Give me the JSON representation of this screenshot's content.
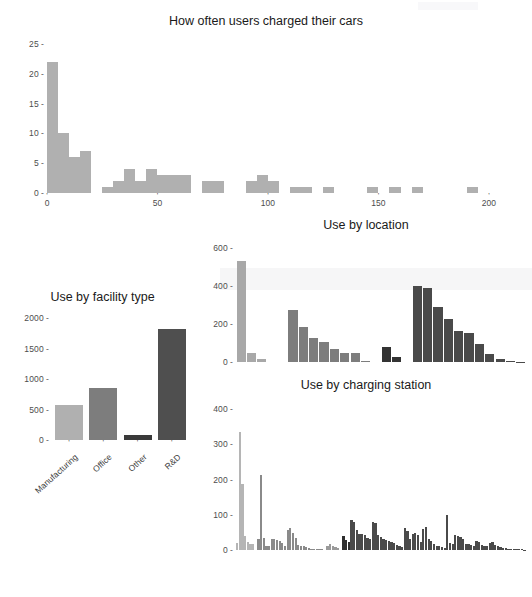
{
  "page": {
    "background": "#ffffff",
    "text_color": "#1a1a1a"
  },
  "colors": {
    "light_gray": "#b0b0b0",
    "mid_gray": "#808080",
    "dark_gray": "#555555",
    "darkest": "#3a3a3a",
    "axis_text": "#4d4d4d"
  },
  "charts": [
    {
      "id": "charge-frequency",
      "title": "How often users charged their cars"
    },
    {
      "id": "use-by-facility-type",
      "title": "Use by facility type"
    },
    {
      "id": "use-by-location",
      "title": "Use by location"
    },
    {
      "id": "use-by-charging-station",
      "title": "Use by charging station"
    }
  ],
  "chart_data": [
    {
      "type": "bar",
      "id": "charge-frequency",
      "title": "How often users charged their cars",
      "xlabel": "",
      "ylabel": "",
      "xlim": [
        0,
        210
      ],
      "ylim": [
        0,
        26
      ],
      "xticks": [
        0,
        50,
        100,
        150,
        200
      ],
      "yticks": [
        0,
        5,
        10,
        15,
        20,
        25
      ],
      "grid": false,
      "bar_color": "#b0b0b0",
      "bin_width": 5,
      "bins": [
        {
          "x0": 0,
          "x1": 5,
          "value": 22
        },
        {
          "x0": 5,
          "x1": 10,
          "value": 10
        },
        {
          "x0": 10,
          "x1": 15,
          "value": 6
        },
        {
          "x0": 15,
          "x1": 20,
          "value": 7
        },
        {
          "x0": 20,
          "x1": 25,
          "value": 0
        },
        {
          "x0": 25,
          "x1": 30,
          "value": 1
        },
        {
          "x0": 30,
          "x1": 35,
          "value": 2
        },
        {
          "x0": 35,
          "x1": 40,
          "value": 4
        },
        {
          "x0": 40,
          "x1": 45,
          "value": 2
        },
        {
          "x0": 45,
          "x1": 50,
          "value": 4
        },
        {
          "x0": 50,
          "x1": 55,
          "value": 3
        },
        {
          "x0": 55,
          "x1": 60,
          "value": 3
        },
        {
          "x0": 60,
          "x1": 65,
          "value": 3
        },
        {
          "x0": 65,
          "x1": 70,
          "value": 0
        },
        {
          "x0": 70,
          "x1": 75,
          "value": 2
        },
        {
          "x0": 75,
          "x1": 80,
          "value": 2
        },
        {
          "x0": 80,
          "x1": 85,
          "value": 0
        },
        {
          "x0": 85,
          "x1": 90,
          "value": 0
        },
        {
          "x0": 90,
          "x1": 95,
          "value": 2
        },
        {
          "x0": 95,
          "x1": 100,
          "value": 3
        },
        {
          "x0": 100,
          "x1": 105,
          "value": 2
        },
        {
          "x0": 105,
          "x1": 110,
          "value": 0
        },
        {
          "x0": 110,
          "x1": 115,
          "value": 1
        },
        {
          "x0": 115,
          "x1": 120,
          "value": 1
        },
        {
          "x0": 120,
          "x1": 125,
          "value": 0
        },
        {
          "x0": 125,
          "x1": 130,
          "value": 1
        },
        {
          "x0": 130,
          "x1": 145,
          "value": 0
        },
        {
          "x0": 145,
          "x1": 150,
          "value": 1
        },
        {
          "x0": 155,
          "x1": 160,
          "value": 1
        },
        {
          "x0": 165,
          "x1": 170,
          "value": 1
        },
        {
          "x0": 190,
          "x1": 195,
          "value": 1
        }
      ]
    },
    {
      "type": "bar",
      "id": "use-by-facility-type",
      "title": "Use by facility type",
      "xlabel": "",
      "ylabel": "",
      "ylim": [
        0,
        2100
      ],
      "yticks": [
        0,
        500,
        1000,
        1500,
        2000
      ],
      "grid": false,
      "categories": [
        "Manufacturing",
        "Office",
        "Other",
        "R&D"
      ],
      "values": [
        580,
        855,
        90,
        1825
      ],
      "bar_colors": [
        "#b0b0b0",
        "#7d7d7d",
        "#3a3a3a",
        "#4f4f4f"
      ]
    },
    {
      "type": "bar",
      "id": "use-by-location",
      "title": "Use by location",
      "xlabel": "",
      "ylabel": "",
      "ylim": [
        0,
        640
      ],
      "yticks": [
        0,
        200,
        400,
        600
      ],
      "grid": false,
      "values": [
        530,
        45,
        18,
        0,
        275,
        182,
        125,
        105,
        70,
        45,
        45,
        3,
        78,
        28,
        398,
        390,
        290,
        228,
        163,
        150,
        95,
        40,
        18,
        5,
        2
      ],
      "bar_colors": [
        "#a8a8a8",
        "#a8a8a8",
        "#a8a8a8",
        "#a8a8a8",
        "#7d7d7d",
        "#7d7d7d",
        "#7d7d7d",
        "#7d7d7d",
        "#7d7d7d",
        "#7d7d7d",
        "#7d7d7d",
        "#7d7d7d",
        "#333333",
        "#333333",
        "#4a4a4a",
        "#4a4a4a",
        "#4a4a4a",
        "#4a4a4a",
        "#4a4a4a",
        "#4a4a4a",
        "#4a4a4a",
        "#4a4a4a",
        "#4a4a4a",
        "#4a4a4a",
        "#4a4a4a"
      ],
      "group_gaps_after": [
        3,
        11,
        13
      ]
    },
    {
      "type": "bar",
      "id": "use-by-charging-station",
      "title": "Use by charging station",
      "xlabel": "",
      "ylabel": "",
      "ylim": [
        0,
        420
      ],
      "yticks": [
        0,
        100,
        200,
        300,
        400
      ],
      "grid": false,
      "values": [
        20,
        335,
        188,
        40,
        22,
        18,
        16,
        0,
        30,
        212,
        35,
        12,
        10,
        30,
        32,
        28,
        26,
        20,
        12,
        58,
        62,
        48,
        35,
        14,
        12,
        10,
        8,
        5,
        4,
        3,
        3,
        2,
        2,
        0,
        10,
        18,
        12,
        8,
        6,
        0,
        40,
        28,
        22,
        84,
        80,
        58,
        45,
        46,
        42,
        35,
        32,
        80,
        78,
        44,
        36,
        30,
        28,
        26,
        22,
        20,
        14,
        10,
        8,
        62,
        55,
        30,
        46,
        48,
        44,
        24,
        60,
        64,
        30,
        26,
        18,
        12,
        10,
        8,
        6,
        98,
        20,
        18,
        42,
        40,
        36,
        30,
        18,
        16,
        14,
        12,
        26,
        24,
        14,
        12,
        10,
        20,
        22,
        14,
        10,
        8,
        6,
        5,
        4,
        4,
        3,
        3,
        2,
        2,
        1
      ],
      "segment_colors": [
        {
          "start": 0,
          "end": 8,
          "color": "#b5b5b5"
        },
        {
          "start": 8,
          "end": 34,
          "color": "#8a8a8a"
        },
        {
          "start": 34,
          "end": 40,
          "color": "#9a9a9a"
        },
        {
          "start": 40,
          "end": 43,
          "color": "#2e2e2e"
        },
        {
          "start": 43,
          "end": 119,
          "color": "#4a4a4a"
        }
      ]
    }
  ]
}
